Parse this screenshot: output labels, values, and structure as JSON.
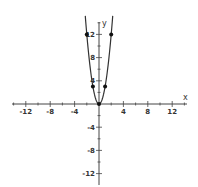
{
  "chart_data": {
    "type": "line",
    "title": "",
    "xlabel": "x",
    "ylabel": "y",
    "xlim": [
      -14,
      14
    ],
    "ylim": [
      -14,
      14
    ],
    "grid": false,
    "x_ticks": [
      -12,
      -8,
      -4,
      4,
      8,
      12
    ],
    "y_ticks": [
      -12,
      -8,
      -4,
      4,
      8,
      12
    ],
    "x_tick_labels": [
      "-12",
      "-8",
      "-4",
      "4",
      "8",
      "12"
    ],
    "y_tick_labels": [
      "-12",
      "-8",
      "-4",
      "4",
      "8",
      "12"
    ],
    "minor_tick_step": 2,
    "series": [
      {
        "name": "y = 3x^2",
        "kind": "curve",
        "function": "3*x^2",
        "x_range": [
          -2.25,
          2.25
        ],
        "color": "#333333"
      },
      {
        "name": "points",
        "kind": "scatter",
        "x": [
          -2,
          -1,
          0,
          1,
          2
        ],
        "y": [
          12,
          3,
          0,
          3,
          12
        ],
        "color": "#111111"
      }
    ]
  },
  "labels": {
    "x_axis": "x",
    "y_axis": "y"
  }
}
